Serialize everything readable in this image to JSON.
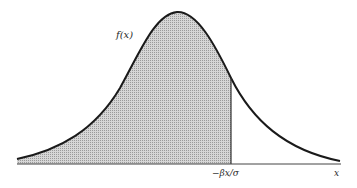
{
  "figure": {
    "type": "normal-distribution-density",
    "curve_label": "f(x)",
    "cutoff_label": "−βx/σ",
    "x_axis_label": "x",
    "shaded_region": "left of cutoff",
    "colors": {
      "curve": "#1a1a1a",
      "shade": "#bdbdbd",
      "axis": "#444444",
      "background": "#ffffff"
    }
  }
}
